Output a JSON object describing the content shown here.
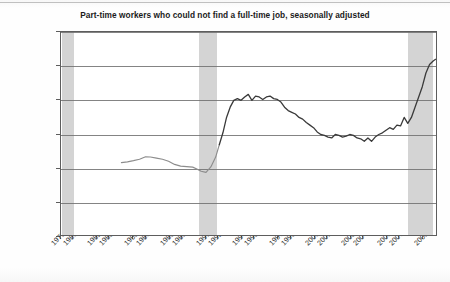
{
  "chart_data": {
    "type": "line",
    "title": "Part-time workers who could not find a full-time job, seasonally adjusted",
    "xlabel": "",
    "ylabel": "",
    "ylim": [
      0,
      1200000
    ],
    "xlim": [
      1979,
      2010.2
    ],
    "grid": true,
    "legend": "none",
    "y_ticks": [
      0,
      200000,
      400000,
      600000,
      800000,
      1000000,
      1200000
    ],
    "y_tick_labels": [
      "0",
      "200 000",
      "400 000",
      "600 000",
      "800 000",
      "1 000 000",
      "1 200 000"
    ],
    "x_tick_labels": [
      "1979",
      "1980",
      "1982",
      "1983",
      "1985",
      "1986",
      "1988",
      "1989",
      "1991",
      "1992",
      "1994",
      "1995",
      "1997",
      "1998",
      "2000",
      "2001",
      "2003",
      "2004",
      "2006",
      "2007",
      "2009"
    ],
    "x_tick_values": [
      1979,
      1980,
      1982,
      1983,
      1985,
      1986,
      1988,
      1989,
      1991,
      1992,
      1994,
      1995,
      1997,
      1998,
      2000,
      2001,
      2003,
      2004,
      2006,
      2007,
      2009
    ],
    "shaded_regions": [
      {
        "name": "recession-1980",
        "start": 1979.1,
        "end": 1980.1
      },
      {
        "name": "recession-1990",
        "start": 1990.4,
        "end": 1991.9
      },
      {
        "name": "recession-2008",
        "start": 2007.7,
        "end": 2009.8
      }
    ],
    "series": [
      {
        "name": "Part-time for economic reasons",
        "color": "#8d8d8d",
        "x": [
          1984.0,
          1984.5,
          1985.0,
          1985.5,
          1986.0,
          1986.4,
          1986.9,
          1987.4,
          1987.9,
          1988.4,
          1988.9,
          1989.4,
          1989.9,
          1990.2,
          1990.6,
          1991.0,
          1991.4,
          1991.8,
          1992.1
        ],
        "values": [
          435000,
          440000,
          447000,
          455000,
          470000,
          468000,
          462000,
          455000,
          443000,
          425000,
          415000,
          412000,
          409000,
          400000,
          385000,
          378000,
          410000,
          468000,
          540000
        ]
      },
      {
        "name": "Part-time for economic reasons (continued)",
        "color": "#3a3a3a",
        "x": [
          1992.1,
          1992.4,
          1992.7,
          1993.0,
          1993.3,
          1993.6,
          1993.9,
          1994.2,
          1994.5,
          1994.8,
          1995.1,
          1995.4,
          1995.7,
          1996.0,
          1996.3,
          1996.6,
          1996.9,
          1997.2,
          1997.5,
          1997.8,
          1998.1,
          1998.4,
          1998.7,
          1999.0,
          1999.3,
          1999.6,
          1999.9,
          2000.2,
          2000.5,
          2000.8,
          2001.1,
          2001.4,
          2001.7,
          2002.0,
          2002.3,
          2002.6,
          2002.9,
          2003.2,
          2003.5,
          2003.8,
          2004.1,
          2004.4,
          2004.7,
          2005.0,
          2005.3,
          2005.6,
          2005.9,
          2006.2,
          2006.5,
          2006.8,
          2007.1,
          2007.4,
          2007.7,
          2008.0,
          2008.3,
          2008.6,
          2008.9,
          2009.2,
          2009.5,
          2009.8,
          2010.0
        ],
        "values": [
          540000,
          610000,
          700000,
          760000,
          800000,
          810000,
          800000,
          820000,
          835000,
          800000,
          825000,
          820000,
          805000,
          820000,
          825000,
          810000,
          805000,
          790000,
          760000,
          740000,
          730000,
          720000,
          700000,
          690000,
          670000,
          655000,
          640000,
          615000,
          600000,
          595000,
          585000,
          580000,
          600000,
          595000,
          585000,
          590000,
          600000,
          595000,
          580000,
          575000,
          560000,
          580000,
          560000,
          585000,
          600000,
          610000,
          625000,
          640000,
          630000,
          655000,
          650000,
          700000,
          665000,
          700000,
          760000,
          820000,
          880000,
          960000,
          1010000,
          1030000,
          1040000
        ]
      }
    ]
  }
}
